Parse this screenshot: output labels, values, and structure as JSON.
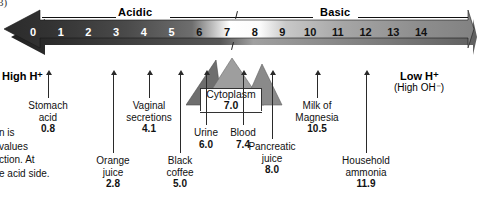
{
  "figure": {
    "marker": "3)",
    "side_note_lines": [
      "n is",
      "values",
      "ction. At",
      "e acid side."
    ]
  },
  "scale": {
    "acidic_label": "Acidic",
    "basic_label": "Basic",
    "ticks": [
      "0",
      "1",
      "2",
      "3",
      "4",
      "5",
      "6",
      "7",
      "8",
      "9",
      "10",
      "11",
      "12",
      "13",
      "14"
    ],
    "left_end_label": "High H⁺",
    "right_end_label": "Low H⁺",
    "right_end_sublabel": "(High OH⁻)",
    "neutral_tick": "7"
  },
  "cytoplasm": {
    "name": "Cytoplasm",
    "value": "7.0"
  },
  "callouts": [
    {
      "name": "stomach-acid",
      "lines": [
        "Stomach",
        "acid"
      ],
      "value": "0.8"
    },
    {
      "name": "orange-juice",
      "lines": [
        "Orange",
        "juice"
      ],
      "value": "2.8"
    },
    {
      "name": "vaginal-secretions",
      "lines": [
        "Vaginal",
        "secretions"
      ],
      "value": "4.1"
    },
    {
      "name": "black-coffee",
      "lines": [
        "Black",
        "coffee"
      ],
      "value": "5.0"
    },
    {
      "name": "urine",
      "lines": [
        "Urine"
      ],
      "value": "6.0"
    },
    {
      "name": "blood",
      "lines": [
        "Blood"
      ],
      "value": "7.4"
    },
    {
      "name": "pancreatic-juice",
      "lines": [
        "Pancreatic",
        "juice"
      ],
      "value": "8.0"
    },
    {
      "name": "milk-of-magnesia",
      "lines": [
        "Milk of",
        "Magnesia"
      ],
      "value": "10.5"
    },
    {
      "name": "household-ammonia",
      "lines": [
        "Household",
        "ammonia"
      ],
      "value": "11.9"
    }
  ],
  "chart_data": {
    "type": "bar",
    "xlabel": "pH",
    "ylabel": "",
    "categories": [
      "0",
      "1",
      "2",
      "3",
      "4",
      "5",
      "6",
      "7",
      "8",
      "9",
      "10",
      "11",
      "12",
      "13",
      "14"
    ],
    "values": [
      0,
      1,
      2,
      3,
      4,
      5,
      6,
      7,
      8,
      9,
      10,
      11,
      12,
      13,
      14
    ],
    "xlim": [
      0,
      14
    ],
    "grid": false,
    "legend": "none",
    "annotations": [
      {
        "label": "Stomach acid",
        "ph": 0.8
      },
      {
        "label": "Orange juice",
        "ph": 2.8
      },
      {
        "label": "Vaginal secretions",
        "ph": 4.1
      },
      {
        "label": "Black coffee",
        "ph": 5.0
      },
      {
        "label": "Urine",
        "ph": 6.0
      },
      {
        "label": "Cytoplasm",
        "ph": 7.0
      },
      {
        "label": "Blood",
        "ph": 7.4
      },
      {
        "label": "Pancreatic juice",
        "ph": 8.0
      },
      {
        "label": "Milk of Magnesia",
        "ph": 10.5
      },
      {
        "label": "Household ammonia",
        "ph": 11.9
      }
    ]
  },
  "colors": {
    "acid_end": "#2f2f2f",
    "neutral": "#f2f2f2",
    "base_end": "#8c8c8c",
    "ink": "#111111",
    "paper": "#ffffff"
  }
}
